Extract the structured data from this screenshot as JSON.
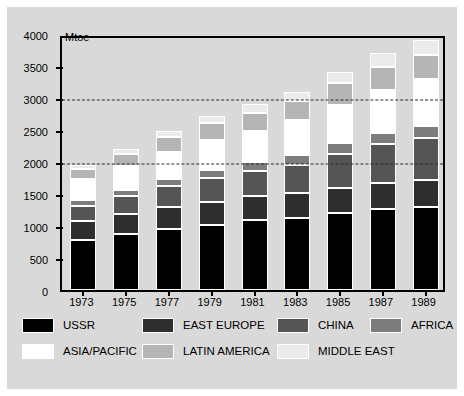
{
  "chart_data": {
    "type": "bar",
    "stacked": true,
    "title": "",
    "subtitle": "",
    "xlabel": "",
    "ylabel": "Mtoe",
    "unit_label": "Mtoe",
    "ylim": [
      0,
      4000
    ],
    "ytick_step": 500,
    "ytick_labels": [
      "4000",
      "3500",
      "3000",
      "2500",
      "2000",
      "1500",
      "1000",
      "500",
      "0"
    ],
    "ytick_values": [
      4000,
      3500,
      3000,
      2500,
      2000,
      1500,
      1000,
      500,
      0
    ],
    "gridlines_dashed_at": [
      3000,
      2000
    ],
    "grid": "dashed-horizontal",
    "legend_position": "bottom",
    "categories": [
      "1973",
      "1975",
      "1977",
      "1979",
      "1981",
      "1983",
      "1985",
      "1987",
      "1989"
    ],
    "series": [
      {
        "name": "USSR",
        "color": "#000000",
        "values": [
          780,
          870,
          950,
          1020,
          1090,
          1130,
          1200,
          1270,
          1300
        ]
      },
      {
        "name": "EAST EUROPE",
        "color": "#2e2e2e",
        "values": [
          300,
          320,
          350,
          360,
          380,
          390,
          400,
          410,
          420
        ]
      },
      {
        "name": "CHINA",
        "color": "#555555",
        "values": [
          230,
          280,
          330,
          370,
          390,
          440,
          520,
          600,
          660
        ]
      },
      {
        "name": "AFRICA",
        "color": "#7d7d7d",
        "values": [
          90,
          100,
          110,
          130,
          140,
          150,
          170,
          180,
          190
        ]
      },
      {
        "name": "ASIA/PACIFIC",
        "color": "#ffffff",
        "values": [
          330,
          370,
          420,
          470,
          490,
          540,
          600,
          660,
          720
        ]
      },
      {
        "name": "LATIN AMERICA",
        "color": "#b5b5b5",
        "values": [
          160,
          190,
          230,
          260,
          280,
          300,
          340,
          370,
          390
        ]
      },
      {
        "name": "MIDDLE EAST",
        "color": "#ebebeb",
        "values": [
          60,
          75,
          90,
          110,
          130,
          150,
          180,
          210,
          230
        ]
      }
    ],
    "totals": [
      1950,
      2205,
      2480,
      2720,
      2900,
      3100,
      3410,
      3700,
      3910
    ]
  },
  "legend": {
    "items": [
      {
        "label": "USSR",
        "color": "#000000"
      },
      {
        "label": "EAST EUROPE",
        "color": "#2e2e2e"
      },
      {
        "label": "CHINA",
        "color": "#555555"
      },
      {
        "label": "AFRICA",
        "color": "#7d7d7d"
      },
      {
        "label": "ASIA/PACIFIC",
        "color": "#ffffff"
      },
      {
        "label": "LATIN AMERICA",
        "color": "#b5b5b5"
      },
      {
        "label": "MIDDLE EAST",
        "color": "#ebebeb"
      }
    ]
  },
  "colors": {
    "panel_background": "#d9d9d9",
    "page_background": "#ffffff",
    "axis": "#000000",
    "gridline": "#2b2b2b"
  }
}
